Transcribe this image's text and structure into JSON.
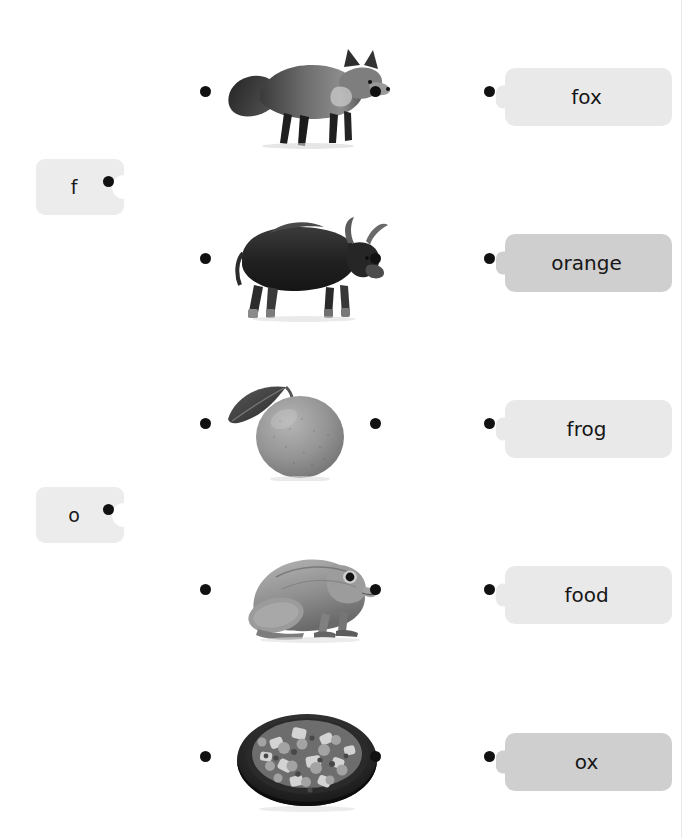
{
  "exercise": {
    "type": "matching-puzzle",
    "title": "Match letters, pictures and words",
    "letter_tiles": [
      {
        "id": "letter-f",
        "label": "f",
        "x": 36,
        "y": 159,
        "dot_x": 108,
        "dot_y": 181
      },
      {
        "id": "letter-o",
        "label": "o",
        "x": 36,
        "y": 487,
        "dot_x": 108,
        "dot_y": 509
      }
    ],
    "picture_rows": [
      {
        "id": "pic-fox",
        "alt": "fox",
        "icon": "fox-photo",
        "left_dot_x": 205,
        "right_dot_x": 375,
        "dot_y": 91,
        "img_x": 224,
        "img_y": 43,
        "img_w": 168,
        "img_h": 106
      },
      {
        "id": "pic-ox",
        "alt": "ox",
        "icon": "ox-photo",
        "left_dot_x": 205,
        "right_dot_x": 375,
        "dot_y": 258,
        "img_x": 224,
        "img_y": 213,
        "img_w": 168,
        "img_h": 110
      },
      {
        "id": "pic-orange",
        "alt": "orange",
        "icon": "orange-photo",
        "left_dot_x": 205,
        "right_dot_x": 375,
        "dot_y": 423,
        "img_x": 224,
        "img_y": 375,
        "img_w": 138,
        "img_h": 106
      },
      {
        "id": "pic-frog",
        "alt": "frog",
        "icon": "frog-photo",
        "left_dot_x": 205,
        "right_dot_x": 375,
        "dot_y": 589,
        "img_x": 236,
        "img_y": 547,
        "img_w": 148,
        "img_h": 96
      },
      {
        "id": "pic-food",
        "alt": "bowl of food",
        "icon": "food-photo",
        "left_dot_x": 205,
        "right_dot_x": 375,
        "dot_y": 756,
        "img_x": 232,
        "img_y": 704,
        "img_w": 150,
        "img_h": 108
      }
    ],
    "word_tiles": [
      {
        "id": "word-fox",
        "label": "fox",
        "tone": "light",
        "x": 505,
        "y": 68,
        "width": 167,
        "dot_x": 489,
        "dot_y": 91
      },
      {
        "id": "word-orange",
        "label": "orange",
        "tone": "dark",
        "x": 505,
        "y": 234,
        "width": 167,
        "dot_x": 489,
        "dot_y": 258
      },
      {
        "id": "word-frog",
        "label": "frog",
        "tone": "light",
        "x": 505,
        "y": 400,
        "width": 167,
        "dot_x": 489,
        "dot_y": 423
      },
      {
        "id": "word-food",
        "label": "food",
        "tone": "light",
        "x": 505,
        "y": 566,
        "width": 167,
        "dot_x": 489,
        "dot_y": 589
      },
      {
        "id": "word-ox",
        "label": "ox",
        "tone": "dark",
        "x": 505,
        "y": 733,
        "width": 167,
        "dot_x": 489,
        "dot_y": 756
      }
    ],
    "edge_rule_x": 681
  },
  "colors": {
    "background": "#ffffff",
    "tile_light": "#e9e9e9",
    "tile_dark": "#cfcfcf",
    "letter_tile": "#ececec",
    "dot": "#111111",
    "text": "#161616",
    "rule": "#e9e9e9"
  }
}
